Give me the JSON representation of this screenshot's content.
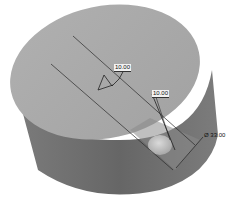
{
  "figure": {
    "colors": {
      "top_face": "#a9a9a9",
      "side_face": "#6e6e6e",
      "side_face_dark": "#5a5a5a",
      "hole": "#cfcfcf",
      "edge_lines": "#2a2a2a",
      "background": "#ffffff"
    },
    "dimensions": {
      "angle_label": "10.00",
      "depth_label": "10.00",
      "diameter_label": "Ø 33.00"
    }
  }
}
